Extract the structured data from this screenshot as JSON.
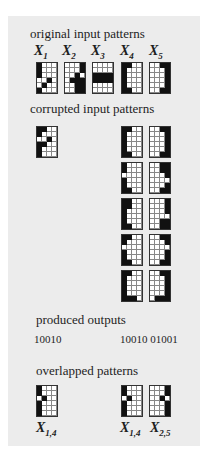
{
  "headings": {
    "original": "original input patterns",
    "corrupted": "corrupted input patterns",
    "outputs": "produced outputs",
    "overlapped": "overlapped patterns"
  },
  "original_patterns": [
    {
      "label": "X",
      "sub": "1",
      "cells": [
        [
          1,
          0,
          0,
          0
        ],
        [
          1,
          0,
          0,
          0
        ],
        [
          1,
          0,
          0,
          0
        ],
        [
          0,
          0,
          1,
          0
        ],
        [
          0,
          1,
          0,
          0
        ],
        [
          1,
          0,
          0,
          0
        ]
      ]
    },
    {
      "label": "X",
      "sub": "2",
      "cells": [
        [
          0,
          0,
          0,
          1
        ],
        [
          0,
          0,
          0,
          1
        ],
        [
          0,
          0,
          1,
          0
        ],
        [
          0,
          1,
          1,
          1
        ],
        [
          0,
          0,
          1,
          1
        ],
        [
          0,
          0,
          1,
          1
        ]
      ]
    },
    {
      "label": "X",
      "sub": "3",
      "cells": [
        [
          0,
          0,
          0,
          0
        ],
        [
          0,
          0,
          0,
          0
        ],
        [
          1,
          1,
          1,
          1
        ],
        [
          1,
          1,
          1,
          1
        ],
        [
          0,
          0,
          0,
          0
        ],
        [
          0,
          0,
          0,
          0
        ]
      ]
    },
    {
      "label": "X",
      "sub": "4",
      "cells": [
        [
          1,
          1,
          0,
          0
        ],
        [
          1,
          0,
          0,
          0
        ],
        [
          1,
          0,
          0,
          0
        ],
        [
          1,
          0,
          0,
          0
        ],
        [
          1,
          0,
          0,
          0
        ],
        [
          1,
          1,
          0,
          0
        ]
      ]
    },
    {
      "label": "X",
      "sub": "5",
      "cells": [
        [
          0,
          0,
          1,
          1
        ],
        [
          0,
          0,
          0,
          1
        ],
        [
          0,
          0,
          0,
          1
        ],
        [
          0,
          0,
          0,
          1
        ],
        [
          0,
          0,
          0,
          1
        ],
        [
          0,
          0,
          1,
          1
        ]
      ]
    }
  ],
  "corrupted_left": {
    "cells": [
      [
        1,
        1,
        0,
        0
      ],
      [
        1,
        0,
        0,
        0
      ],
      [
        0,
        0,
        1,
        0
      ],
      [
        1,
        1,
        0,
        0
      ],
      [
        1,
        0,
        0,
        0
      ],
      [
        1,
        0,
        0,
        0
      ]
    ]
  },
  "corrupted_right": [
    {
      "cells": [
        [
          1,
          1,
          0,
          0
        ],
        [
          1,
          0,
          0,
          0
        ],
        [
          1,
          0,
          0,
          0
        ],
        [
          1,
          0,
          0,
          0
        ],
        [
          1,
          0,
          0,
          0
        ],
        [
          1,
          1,
          0,
          0
        ]
      ]
    },
    {
      "cells": [
        [
          0,
          0,
          1,
          1
        ],
        [
          0,
          0,
          0,
          1
        ],
        [
          0,
          0,
          0,
          1
        ],
        [
          0,
          0,
          0,
          1
        ],
        [
          0,
          0,
          0,
          1
        ],
        [
          0,
          0,
          1,
          1
        ]
      ]
    },
    {
      "cells": [
        [
          1,
          0,
          0,
          0
        ],
        [
          1,
          0,
          0,
          0
        ],
        [
          0,
          0,
          0,
          0
        ],
        [
          1,
          0,
          0,
          0
        ],
        [
          1,
          0,
          0,
          0
        ],
        [
          1,
          1,
          0,
          0
        ]
      ]
    },
    {
      "cells": [
        [
          0,
          0,
          1,
          1
        ],
        [
          0,
          0,
          1,
          1
        ],
        [
          0,
          0,
          0,
          1
        ],
        [
          0,
          0,
          0,
          0
        ],
        [
          0,
          0,
          0,
          1
        ],
        [
          0,
          0,
          1,
          1
        ]
      ]
    },
    {
      "cells": [
        [
          1,
          1,
          0,
          0
        ],
        [
          1,
          1,
          0,
          0
        ],
        [
          1,
          0,
          0,
          0
        ],
        [
          1,
          0,
          0,
          0
        ],
        [
          1,
          0,
          0,
          0
        ],
        [
          1,
          1,
          0,
          0
        ]
      ]
    },
    {
      "cells": [
        [
          0,
          0,
          0,
          1
        ],
        [
          0,
          0,
          0,
          1
        ],
        [
          0,
          0,
          0,
          1
        ],
        [
          0,
          0,
          0,
          0
        ],
        [
          0,
          0,
          1,
          1
        ],
        [
          0,
          0,
          1,
          1
        ]
      ]
    },
    {
      "cells": [
        [
          1,
          1,
          0,
          0
        ],
        [
          1,
          0,
          0,
          0
        ],
        [
          0,
          0,
          0,
          0
        ],
        [
          1,
          0,
          0,
          0
        ],
        [
          1,
          0,
          0,
          0
        ],
        [
          1,
          1,
          0,
          0
        ]
      ]
    },
    {
      "cells": [
        [
          0,
          0,
          1,
          1
        ],
        [
          0,
          0,
          0,
          1
        ],
        [
          0,
          0,
          0,
          0
        ],
        [
          0,
          0,
          0,
          1
        ],
        [
          0,
          0,
          0,
          1
        ],
        [
          0,
          0,
          1,
          1
        ]
      ]
    },
    {
      "cells": [
        [
          1,
          1,
          0,
          0
        ],
        [
          1,
          0,
          0,
          0
        ],
        [
          1,
          0,
          0,
          0
        ],
        [
          1,
          0,
          0,
          0
        ],
        [
          1,
          0,
          0,
          0
        ],
        [
          1,
          1,
          1,
          0
        ]
      ]
    },
    {
      "cells": [
        [
          0,
          0,
          1,
          1
        ],
        [
          0,
          0,
          0,
          1
        ],
        [
          0,
          0,
          0,
          1
        ],
        [
          0,
          0,
          0,
          1
        ],
        [
          0,
          0,
          0,
          1
        ],
        [
          0,
          1,
          1,
          1
        ]
      ]
    }
  ],
  "outputs": {
    "left": "10010",
    "right": "10010 01001"
  },
  "overlapped_patterns": [
    {
      "label": "X",
      "sub": "1,4",
      "cells": [
        [
          1,
          0,
          0,
          0
        ],
        [
          1,
          0,
          0,
          0
        ],
        [
          0,
          1,
          0,
          0
        ],
        [
          1,
          0,
          0,
          0
        ],
        [
          1,
          0,
          0,
          0
        ],
        [
          1,
          0,
          0,
          0
        ]
      ]
    },
    {
      "label": "X",
      "sub": "1,4",
      "cells": [
        [
          1,
          0,
          0,
          0
        ],
        [
          1,
          0,
          0,
          0
        ],
        [
          0,
          1,
          0,
          0
        ],
        [
          1,
          0,
          0,
          0
        ],
        [
          1,
          0,
          0,
          0
        ],
        [
          1,
          0,
          0,
          0
        ]
      ]
    },
    {
      "label": "X",
      "sub": "2,5",
      "cells": [
        [
          0,
          0,
          0,
          1
        ],
        [
          0,
          0,
          0,
          1
        ],
        [
          0,
          0,
          1,
          0
        ],
        [
          0,
          0,
          0,
          1
        ],
        [
          0,
          0,
          0,
          1
        ],
        [
          0,
          0,
          0,
          1
        ]
      ]
    }
  ]
}
